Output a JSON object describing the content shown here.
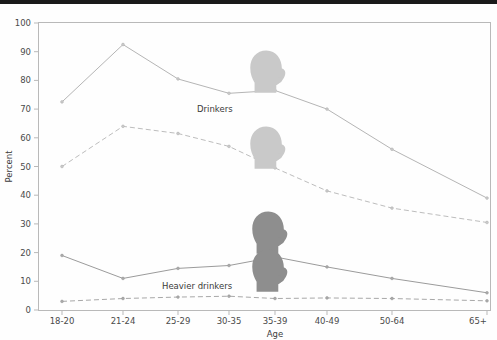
{
  "chart_data": {
    "type": "line",
    "title": "",
    "xlabel": "Age",
    "ylabel": "Percent",
    "ylim": [
      0,
      100
    ],
    "yticks": [
      0,
      10,
      20,
      30,
      40,
      50,
      60,
      70,
      80,
      90,
      100
    ],
    "categories": [
      "18-20",
      "21-24",
      "25-29",
      "30-35",
      "35-39",
      "40-49",
      "50-64",
      "65+"
    ],
    "grid": false,
    "legend_position": "inline-annotations",
    "annotations": [
      "Drinkers",
      "Heavier drinkers"
    ],
    "series": [
      {
        "name": "Drinkers - men",
        "style": "solid",
        "color": "#b5b5b5",
        "values": [
          72.5,
          92.5,
          80.5,
          75.5,
          76.5,
          70.0,
          56.0,
          39.0
        ]
      },
      {
        "name": "Drinkers - women",
        "style": "dashed",
        "color": "#bdbdbd",
        "values": [
          50.0,
          64.0,
          61.5,
          57.0,
          49.5,
          41.5,
          35.5,
          30.5
        ]
      },
      {
        "name": "Heavier drinkers - men",
        "style": "solid",
        "color": "#9b9b9b",
        "values": [
          19.0,
          11.0,
          14.5,
          15.5,
          18.5,
          15.0,
          11.0,
          6.0
        ]
      },
      {
        "name": "Heavier drinkers - women",
        "style": "dashed",
        "color": "#a8a8a8",
        "values": [
          3.0,
          4.0,
          4.5,
          4.8,
          4.0,
          4.2,
          4.0,
          3.2
        ]
      }
    ]
  },
  "axes": {
    "y_title": "Percent",
    "x_title": "Age",
    "y_tick_labels": [
      "100",
      "90",
      "80",
      "70",
      "60",
      "50",
      "40",
      "30",
      "20",
      "10",
      "0"
    ],
    "x_tick_labels": [
      "18-20",
      "21-24",
      "25-29",
      "30-35",
      "35-39",
      "40-49",
      "50-64",
      "65+"
    ]
  },
  "labels": {
    "drinkers": "Drinkers",
    "heavier_drinkers": "Heavier drinkers"
  },
  "icons": {
    "male_head": "head-silhouette-icon",
    "female_head": "head-silhouette-icon"
  }
}
